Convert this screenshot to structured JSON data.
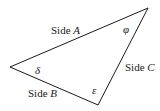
{
  "diagram": {
    "type": "triangle",
    "stroke_color": "#1a1a1a",
    "vertices": {
      "left": {
        "x": 10,
        "y": 67
      },
      "top_right": {
        "x": 148,
        "y": 8
      },
      "bottom": {
        "x": 98,
        "y": 105
      }
    },
    "sides": [
      {
        "id": "A",
        "prefix": "Side ",
        "letter": "A"
      },
      {
        "id": "B",
        "prefix": "Side ",
        "letter": "B"
      },
      {
        "id": "C",
        "prefix": "Side ",
        "letter": "C"
      }
    ],
    "angles": [
      {
        "id": "delta",
        "symbol": "δ",
        "vertex": "left"
      },
      {
        "id": "phi",
        "symbol": "φ",
        "vertex": "top_right"
      },
      {
        "id": "epsilon",
        "symbol": "ε",
        "vertex": "bottom"
      }
    ]
  }
}
